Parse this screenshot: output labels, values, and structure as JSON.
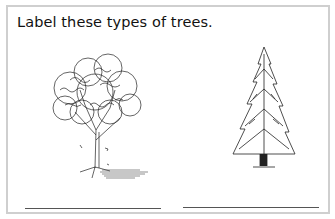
{
  "worksheet": {
    "instruction": "Label these types of trees.",
    "images": [
      {
        "name": "deciduous-tree-illustration",
        "description": "leafy broadleaf tree with falling leaves and shadow"
      },
      {
        "name": "evergreen-tree-illustration",
        "description": "conical conifer / pine tree"
      }
    ],
    "answer_lines": [
      {
        "value": ""
      },
      {
        "value": ""
      }
    ],
    "colors": {
      "border": "#cfcfcf",
      "ink": "#111111",
      "line": "#555555"
    }
  }
}
